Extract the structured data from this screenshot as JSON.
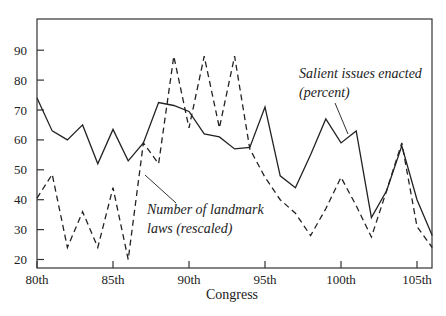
{
  "chart_data": {
    "type": "line",
    "title": "",
    "xlabel": "Congress",
    "ylabel": "",
    "ylim": [
      17,
      98
    ],
    "xlim": [
      80,
      106
    ],
    "grid": false,
    "legend": "inline annotations",
    "x": [
      80,
      81,
      82,
      83,
      84,
      85,
      86,
      87,
      88,
      89,
      90,
      91,
      92,
      93,
      94,
      95,
      96,
      97,
      98,
      99,
      100,
      101,
      102,
      103,
      104,
      105,
      106
    ],
    "x_tick_values": [
      80,
      85,
      90,
      95,
      100,
      105
    ],
    "x_tick_labels": [
      "80th",
      "85th",
      "90th",
      "95th",
      "100th",
      "105th"
    ],
    "y_tick_values": [
      20,
      30,
      40,
      50,
      60,
      70,
      80,
      90
    ],
    "y_tick_labels": [
      "20",
      "30",
      "40",
      "50",
      "60",
      "70",
      "80",
      "90"
    ],
    "series": [
      {
        "name": "Salient issues enacted (percent)",
        "style": "solid",
        "values": [
          74,
          63,
          60,
          65,
          52,
          63.5,
          53,
          59,
          72.5,
          71.5,
          69.5,
          62,
          61,
          57,
          57.5,
          71,
          48,
          44,
          55,
          67,
          59,
          63,
          34,
          43,
          58,
          40,
          28
        ]
      },
      {
        "name": "Number of landmark laws (rescaled)",
        "style": "dashed",
        "values": [
          40.5,
          48.5,
          24,
          36,
          24,
          44,
          20,
          59,
          52,
          88,
          64,
          88,
          64,
          88,
          57,
          47.5,
          40,
          35.5,
          28,
          37,
          47.5,
          38,
          27.5,
          43,
          59,
          31,
          24
        ]
      }
    ],
    "annotations": [
      {
        "series": 0,
        "lines": [
          "Salient issues enacted",
          "(percent)"
        ],
        "x": 299,
        "y": 78,
        "leader": [
          335,
          103,
          348,
          134
        ]
      },
      {
        "series": 1,
        "lines": [
          "Number of landmark",
          "laws (rescaled)"
        ],
        "x": 147,
        "y": 214,
        "leader": [
          145,
          175,
          176,
          203
        ]
      }
    ]
  }
}
